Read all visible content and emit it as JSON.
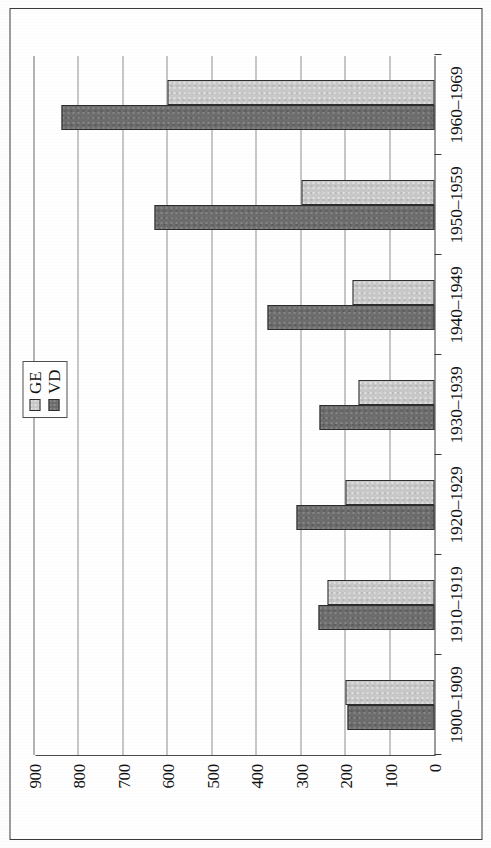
{
  "figure": {
    "orientation": "rotated-90-landscape",
    "colors": {
      "ge_fill": "#c8c8c8",
      "vd_fill": "#6d6d6d",
      "bar_outline": "#2d2d2d",
      "gridline": "#8f8f8f",
      "axis": "#3a3a3a",
      "text": "#111111",
      "page_background": "#fdfdfd",
      "plot_background": "#ffffff"
    }
  },
  "legend": {
    "position": "inside-top-right",
    "entries": [
      {
        "label": "GE",
        "swatch": "light-gray-square",
        "color": "#c8c8c8"
      },
      {
        "label": "VD",
        "swatch": "dark-gray-square",
        "color": "#6d6d6d"
      }
    ]
  },
  "value_axis": {
    "ticks": [
      "0",
      "100",
      "200",
      "300",
      "400",
      "500",
      "600",
      "700",
      "800",
      "900"
    ],
    "min": 0,
    "max": 900,
    "step": 100,
    "grid": true
  },
  "chart_data": {
    "type": "bar",
    "title": "",
    "subtitle": "",
    "xlabel": "",
    "ylabel": "",
    "orientation": "horizontal-bars-rotated-page",
    "categories": [
      "1900–1909",
      "1910–1919",
      "1920–1929",
      "1930–1939",
      "1940–1949",
      "1950–1959",
      "1960–1969"
    ],
    "series": [
      {
        "name": "GE",
        "color": "#c8c8c8",
        "values": [
          200,
          240,
          200,
          170,
          185,
          300,
          600
        ]
      },
      {
        "name": "VD",
        "color": "#6d6d6d",
        "values": [
          195,
          260,
          310,
          258,
          375,
          630,
          840
        ]
      }
    ],
    "ylim": [
      0,
      900
    ],
    "yticks": [
      0,
      100,
      200,
      300,
      400,
      500,
      600,
      700,
      800,
      900
    ],
    "grid": true,
    "legend_entries": [
      "GE",
      "VD"
    ],
    "legend_position": "inside-top-right",
    "annotations": []
  }
}
